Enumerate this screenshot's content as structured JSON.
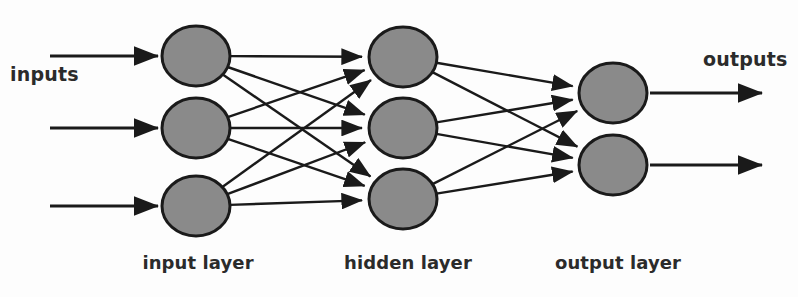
{
  "diagram": {
    "labels": {
      "inputs": "inputs",
      "outputs": "outputs"
    },
    "captions": {
      "input_layer": "input layer",
      "hidden_layer": "hidden layer",
      "output_layer": "output layer"
    },
    "colors": {
      "background": "#fdfdfd",
      "node_fill": "#8a8a8a",
      "node_stroke": "#1a1a1a",
      "edge": "#1a1a1a",
      "text": "#2b2b2b"
    },
    "style": {
      "node_rx": 34,
      "node_ry": 30,
      "node_stroke_width": 3,
      "edge_width": 2.4,
      "arrow_width": 2.8
    },
    "layers": [
      {
        "id": "input",
        "name": "input layer",
        "node_count": 3,
        "nodes": [
          {
            "id": "i1",
            "cx": 196,
            "cy": 56
          },
          {
            "id": "i2",
            "cx": 196,
            "cy": 128
          },
          {
            "id": "i3",
            "cx": 196,
            "cy": 206
          }
        ]
      },
      {
        "id": "hidden",
        "name": "hidden layer",
        "node_count": 3,
        "nodes": [
          {
            "id": "h1",
            "cx": 403,
            "cy": 57
          },
          {
            "id": "h2",
            "cx": 403,
            "cy": 128
          },
          {
            "id": "h3",
            "cx": 403,
            "cy": 199
          }
        ]
      },
      {
        "id": "output",
        "name": "output layer",
        "node_count": 2,
        "nodes": [
          {
            "id": "o1",
            "cx": 613,
            "cy": 93
          },
          {
            "id": "o2",
            "cx": 613,
            "cy": 165
          }
        ]
      }
    ],
    "input_arrows": [
      {
        "x1": 50,
        "y1": 56,
        "x2": 158,
        "y2": 56
      },
      {
        "x1": 50,
        "y1": 128,
        "x2": 158,
        "y2": 128
      },
      {
        "x1": 50,
        "y1": 206,
        "x2": 158,
        "y2": 206
      }
    ],
    "output_arrows": [
      {
        "x1": 650,
        "y1": 93,
        "x2": 762,
        "y2": 93
      },
      {
        "x1": 650,
        "y1": 165,
        "x2": 762,
        "y2": 165
      }
    ],
    "connections": {
      "input_to_hidden": [
        [
          "i1",
          "h1"
        ],
        [
          "i1",
          "h2"
        ],
        [
          "i1",
          "h3"
        ],
        [
          "i2",
          "h1"
        ],
        [
          "i2",
          "h2"
        ],
        [
          "i2",
          "h3"
        ],
        [
          "i3",
          "h1"
        ],
        [
          "i3",
          "h2"
        ],
        [
          "i3",
          "h3"
        ]
      ],
      "hidden_to_output": [
        [
          "h1",
          "o1"
        ],
        [
          "h1",
          "o2"
        ],
        [
          "h2",
          "o1"
        ],
        [
          "h2",
          "o2"
        ],
        [
          "h3",
          "o1"
        ],
        [
          "h3",
          "o2"
        ]
      ]
    }
  }
}
